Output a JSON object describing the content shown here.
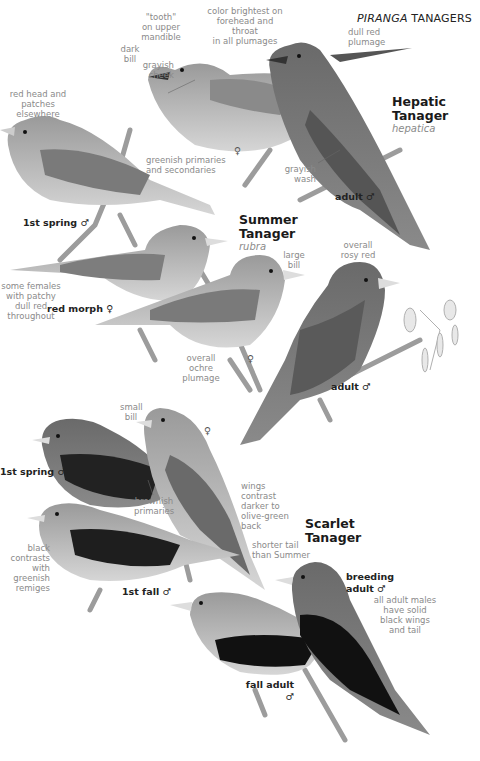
{
  "header": {
    "genus": "PIRANGA",
    "title": "TANAGERS"
  },
  "species": [
    {
      "name_line1": "Hepatic",
      "name_line2": "Tanager",
      "scientific": "hepatica"
    },
    {
      "name_line1": "Summer",
      "name_line2": "Tanager",
      "scientific": "rubra"
    },
    {
      "name_line1": "Scarlet",
      "name_line2": "Tanager",
      "scientific": ""
    }
  ],
  "labels": {
    "hepatic_female": "♀",
    "hepatic_adult_male": "adult ♂",
    "summer_1st_spring_male": "1st spring ♂",
    "summer_red_morph_female": "red morph ♀",
    "summer_female": "♀",
    "summer_adult_male": "adult ♂",
    "scarlet_1st_spring_male": "1st spring ♂",
    "scarlet_female": "♀",
    "scarlet_1st_fall_male": "1st fall ♂",
    "scarlet_breeding_adult_male_line1": "breeding",
    "scarlet_breeding_adult_male_line2": "adult ♂",
    "scarlet_fall_adult_male_line1": "fall adult",
    "scarlet_fall_adult_male_line2": "♂"
  },
  "notes": {
    "tooth": [
      "\"tooth\"",
      "on upper",
      "mandible"
    ],
    "dark_bill": [
      "dark",
      "bill"
    ],
    "grayish_cheek": [
      "grayish",
      "cheek"
    ],
    "color_brightest": [
      "color brightest on",
      "forehead and throat",
      "in all plumages"
    ],
    "dull_red": [
      "dull red",
      "plumage"
    ],
    "grayish_wash": [
      "grayish",
      "wash"
    ],
    "red_head": [
      "red head and",
      "patches elsewhere"
    ],
    "greenish_primaries": [
      "greenish primaries",
      "and secondaries"
    ],
    "some_females": [
      "some females",
      "with patchy dull red",
      "throughout"
    ],
    "large_bill": [
      "large",
      "bill"
    ],
    "overall_rosy": [
      "overall",
      "rosy red"
    ],
    "overall_ochre": [
      "overall ochre",
      "plumage"
    ],
    "small_bill": [
      "small",
      "bill"
    ],
    "brownish_primaries": [
      "brownish",
      "primaries"
    ],
    "wings_contrast": [
      "wings",
      "contrast",
      "darker to",
      "olive-green",
      "back"
    ],
    "shorter_tail": [
      "shorter tail",
      "than Summer"
    ],
    "black_contrasts": [
      "black",
      "contrasts",
      "with greenish",
      "remiges"
    ],
    "all_adult_males": [
      "all adult males",
      "have solid",
      "black wings",
      "and tail"
    ]
  }
}
